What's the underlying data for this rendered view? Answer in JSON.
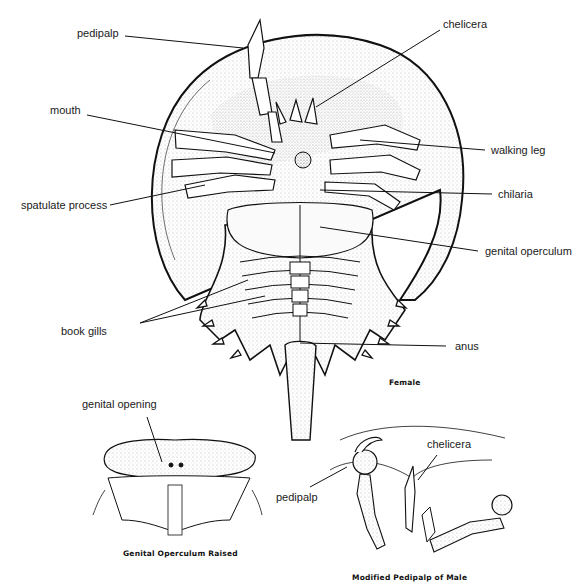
{
  "diagram": {
    "main_view": {
      "caption": "Female",
      "labels": {
        "pedipalp": "pedipalp",
        "chelicera": "chelicera",
        "mouth": "mouth",
        "walking_leg": "walking leg",
        "spatulate_process": "spatulate process",
        "chilaria": "chilaria",
        "genital_operculum": "genital operculum",
        "book_gills": "book gills",
        "anus": "anus"
      }
    },
    "inset_left": {
      "caption": "Genital Operculum Raised",
      "labels": {
        "genital_opening": "genital opening"
      }
    },
    "inset_right": {
      "caption": "Modified Pedipalp of Male",
      "labels": {
        "pedipalp": "pedipalp",
        "chelicera": "chelicera"
      }
    },
    "colors": {
      "ink": "#111111",
      "background": "#ffffff",
      "stipple": "#d9d9d9"
    }
  }
}
